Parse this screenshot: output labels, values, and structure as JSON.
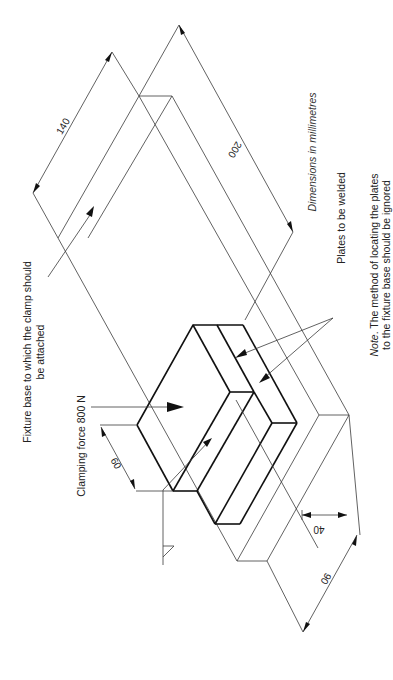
{
  "figure": {
    "type": "isometric engineering drawing (rotated 90°)",
    "units_note": "Dimensions in millimetres",
    "labels": {
      "fixture_line1": "Fixture base to which the clamp should",
      "fixture_line2": "be attached",
      "clamping_force": "Clamping force 800 N",
      "plates": "Plates to be welded",
      "note_prefix": "Note",
      "note_line1_rest": ". The method of locating the plates",
      "note_line2": "to the fixture base should be ignored"
    },
    "dimensions": {
      "base_width": "140",
      "base_length": "200",
      "plate_overhang": "60",
      "plate_offset": "40",
      "plate_length": "90"
    },
    "colors": {
      "ink": "#111111",
      "thin_line": "#3a3a3a",
      "background": "#ffffff"
    }
  }
}
